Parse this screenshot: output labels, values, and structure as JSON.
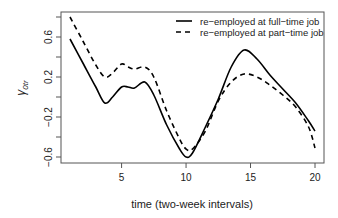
{
  "chart_data": {
    "type": "line",
    "title": "",
    "xlabel": "time (two-week intervals)",
    "ylabel": "γ0tr",
    "ylabel_main": "γ",
    "ylabel_sub": "0tr",
    "xlim": [
      1,
      20
    ],
    "ylim": [
      -0.65,
      0.85
    ],
    "xticks": [
      5,
      10,
      15,
      20
    ],
    "yticks": [
      0.8,
      0.6,
      0.4,
      0.2,
      0.0,
      -0.2,
      -0.4,
      -0.6
    ],
    "ytick_labels": [
      "",
      "0.6",
      "",
      "0.2",
      "",
      "-0.2",
      "",
      "-0.6"
    ],
    "grid": false,
    "legend_position": "top-right",
    "x": [
      1,
      2,
      3,
      3.7,
      4.3,
      5,
      5.5,
      6,
      6.8,
      7.5,
      8.5,
      9.5,
      10,
      10.5,
      11.5,
      12.5,
      13.5,
      14.5,
      15.5,
      16.5,
      17.5,
      18.5,
      19.5,
      20
    ],
    "series": [
      {
        "name": "re-employed at full-time job",
        "style": "solid",
        "values": [
          0.58,
          0.34,
          0.1,
          -0.06,
          0.0,
          0.1,
          0.1,
          0.09,
          0.15,
          0.02,
          -0.28,
          -0.52,
          -0.6,
          -0.56,
          -0.3,
          -0.02,
          0.3,
          0.47,
          0.38,
          0.22,
          0.08,
          -0.06,
          -0.24,
          -0.34
        ]
      },
      {
        "name": "re-employed at part-time job",
        "style": "dashed",
        "values": [
          0.8,
          0.56,
          0.32,
          0.2,
          0.24,
          0.33,
          0.3,
          0.28,
          0.3,
          0.2,
          -0.14,
          -0.42,
          -0.52,
          -0.52,
          -0.34,
          -0.04,
          0.15,
          0.23,
          0.2,
          0.12,
          0.02,
          -0.1,
          -0.3,
          -0.51
        ]
      }
    ]
  },
  "legend": {
    "items": [
      {
        "label": "re-employed at full-time job",
        "style": "solid"
      },
      {
        "label": "re-employed at part-time job",
        "style": "dashed"
      }
    ]
  },
  "axis": {
    "x_tick_labels": [
      "5",
      "10",
      "15",
      "20"
    ],
    "y_tick_labels": [
      "0.6",
      "0.2",
      "-0.2",
      "-0.6"
    ]
  },
  "colors": {
    "line": "#000000",
    "axis": "#555555",
    "text": "#222222"
  }
}
